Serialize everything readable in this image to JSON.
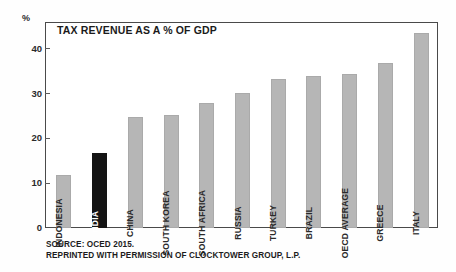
{
  "chart_data": {
    "type": "bar",
    "title": "TAX REVENUE AS A % OF GDP",
    "xlabel": "",
    "ylabel": "%",
    "ylim": [
      0,
      46
    ],
    "yticks": [
      0,
      10,
      20,
      30,
      40
    ],
    "grid": false,
    "legend": "none",
    "orientation": "vertical",
    "categories": [
      "INDONESIA",
      "INDIA",
      "CHINA",
      "SOUTH KOREA",
      "SOUTH AFRICA",
      "RUSSIA",
      "TURKEY",
      "BRAZIL",
      "OECD AVERAGE",
      "GREECE",
      "ITALY"
    ],
    "values": [
      11.8,
      16.7,
      24.7,
      25.2,
      28.0,
      30.2,
      33.3,
      34.0,
      34.5,
      36.9,
      43.5
    ],
    "highlight_index": 1,
    "colors": {
      "bar": "#b6b6b6",
      "bar_highlight": "#141414",
      "axis": "#4a4a4a",
      "text": "#1b1b1b"
    }
  },
  "source": {
    "line1": "SOURCE: OCED 2015.",
    "line2": "REPRINTED WITH PERMISSION OF CLOCKTOWER GROUP, L.P."
  }
}
